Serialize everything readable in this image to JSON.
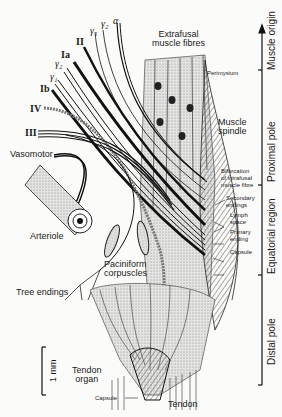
{
  "diagram": {
    "nerve_labels": [
      {
        "id": "gamma1_top",
        "text": "γ₁"
      },
      {
        "id": "gamma2_top",
        "text": "γ₂"
      },
      {
        "id": "alpha",
        "text": "α"
      },
      {
        "id": "II",
        "text": "II"
      },
      {
        "id": "Ia",
        "text": "Ia"
      },
      {
        "id": "gamma2",
        "text": "γ₂"
      },
      {
        "id": "gamma1",
        "text": "γ₁"
      },
      {
        "id": "Ib",
        "text": "Ib"
      },
      {
        "id": "IV",
        "text": "IV"
      },
      {
        "id": "III",
        "text": "III"
      }
    ],
    "structure_labels": {
      "vasomotor": "Vasomotor",
      "arteriole": "Arteriole",
      "tree_endings": "Tree endings",
      "paciniform_1": "Paciniform",
      "paciniform_2": "corpuscles",
      "extrafusal_1": "Extrafusal",
      "extrafusal_2": "muscle fibres",
      "perimysium": "Perimysium",
      "spindle_1": "Muscle",
      "spindle_2": "spindle",
      "bifurcation_1": "Bifurcation",
      "bifurcation_2": "of intrafusal",
      "bifurcation_3": "muscle fibre",
      "secondary_1": "Secondary",
      "secondary_2": "endings",
      "lymph_1": "Lymph",
      "lymph_2": "space",
      "primary_1": "Primary",
      "primary_2": "ending",
      "capsule": "Capsule",
      "tendon_organ_1": "Tendon",
      "tendon_organ_2": "organ",
      "capsule_small": "Capsule",
      "tendon": "Tendon"
    },
    "scale_bar": {
      "label": "1 mm"
    },
    "regions": {
      "muscle_origin": "Muscle origin",
      "proximal_pole": "Proximal pole",
      "equatorial_region": "Equatorial region",
      "distal_pole": "Distal pole"
    },
    "colors": {
      "ink": "#1a1a1a",
      "paper": "#fbfbf9",
      "stipple": "#bdbdbd"
    }
  }
}
